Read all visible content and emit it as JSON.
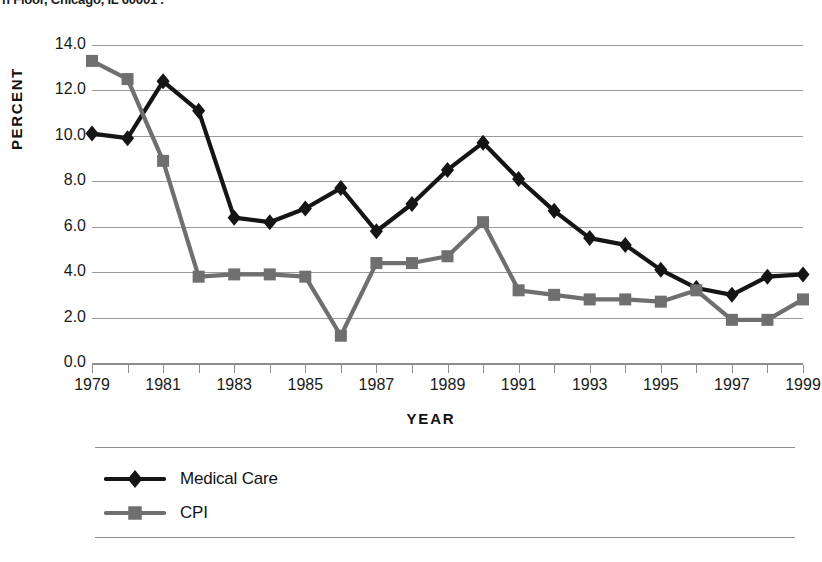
{
  "header": {
    "clipped_text": "h Floor, Chicago, IL 60601 ."
  },
  "chart_data": {
    "type": "line",
    "title": "",
    "xlabel": "YEAR",
    "ylabel": "PERCENT",
    "x": [
      1979,
      1980,
      1981,
      1982,
      1983,
      1984,
      1985,
      1986,
      1987,
      1988,
      1989,
      1990,
      1991,
      1992,
      1993,
      1994,
      1995,
      1996,
      1997,
      1998,
      1999
    ],
    "xtick_labels": [
      "1979",
      "1981",
      "1983",
      "1985",
      "1987",
      "1989",
      "1991",
      "1993",
      "1995",
      "1997",
      "1999"
    ],
    "xtick_values": [
      1979,
      1981,
      1983,
      1985,
      1987,
      1989,
      1991,
      1993,
      1995,
      1997,
      1999
    ],
    "ytick_labels": [
      "0.0",
      "2.0",
      "4.0",
      "6.0",
      "8.0",
      "10.0",
      "12.0",
      "14.0"
    ],
    "ytick_values": [
      0.0,
      2.0,
      4.0,
      6.0,
      8.0,
      10.0,
      12.0,
      14.0
    ],
    "ylim": [
      0.0,
      14.0
    ],
    "xlim": [
      1979,
      1999
    ],
    "grid": "horizontal",
    "legend_position": "bottom-left",
    "series": [
      {
        "name": "Medical Care",
        "marker": "diamond",
        "color": "#151515",
        "values": [
          10.1,
          9.9,
          12.4,
          11.1,
          6.4,
          6.2,
          6.8,
          7.7,
          5.8,
          7.0,
          8.5,
          9.7,
          8.1,
          6.7,
          5.5,
          5.2,
          4.1,
          3.3,
          3.0,
          3.8,
          3.9
        ]
      },
      {
        "name": "CPI",
        "marker": "square",
        "color": "#6f6f6f",
        "values": [
          13.3,
          12.5,
          8.9,
          3.8,
          3.9,
          3.9,
          3.8,
          1.2,
          4.4,
          4.4,
          4.7,
          6.2,
          3.2,
          3.0,
          2.8,
          2.8,
          2.7,
          3.2,
          1.9,
          1.9,
          2.8
        ]
      }
    ]
  },
  "legend": {
    "items": [
      {
        "label": "Medical Care",
        "marker": "diamond",
        "color": "#151515"
      },
      {
        "label": "CPI",
        "marker": "square",
        "color": "#6f6f6f"
      }
    ]
  },
  "colors": {
    "medical_care": "#151515",
    "cpi": "#6f6f6f",
    "gridline": "#9a9a9a",
    "axis": "#8d8d8d",
    "text": "#1a1a1a",
    "background": "#ffffff"
  }
}
